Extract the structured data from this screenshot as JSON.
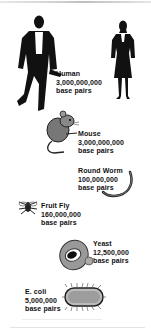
{
  "organisms": [
    {
      "name": "Human",
      "size": "3,000,000,000",
      "unit": "base pairs",
      "icon": "human-silhouettes-icon"
    },
    {
      "name": "Mouse",
      "size": "3,000,000,000",
      "unit": "base pairs",
      "icon": "mouse-icon"
    },
    {
      "name": "Round Worm",
      "size": "100,000,000",
      "unit": "base pairs",
      "icon": "worm-icon"
    },
    {
      "name": "Fruit Fly",
      "size": "160,000,000",
      "unit": "base pairs",
      "icon": "fruit-fly-icon"
    },
    {
      "name": "Yeast",
      "size": "12,500,000",
      "unit": "base pairs",
      "icon": "yeast-cell-icon"
    },
    {
      "name": "E. coli",
      "size": "5,000,000",
      "unit": "base pairs",
      "icon": "bacterium-icon"
    }
  ]
}
